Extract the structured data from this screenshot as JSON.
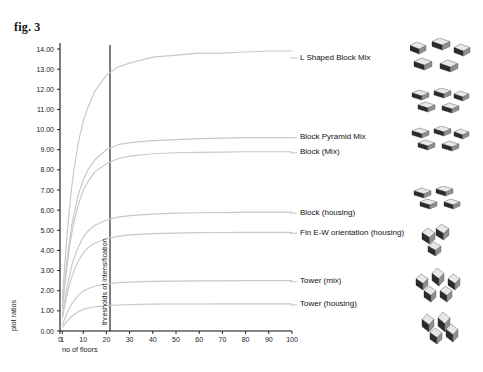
{
  "figure": {
    "label": "fig. 3"
  },
  "chart_data": {
    "type": "line",
    "title": "",
    "xlabel": "no of floors",
    "ylabel": "plot ratios",
    "xlim": [
      0,
      100
    ],
    "ylim": [
      0,
      14
    ],
    "grid": false,
    "legend_position": "right-inline",
    "x_ticks": [
      "0",
      "1",
      "10",
      "20",
      "30",
      "40",
      "50",
      "60",
      "70",
      "80",
      "90",
      "100"
    ],
    "y_ticks": [
      "0.00",
      "1.00",
      "2.00",
      "3.00",
      "4.00",
      "5.00",
      "6.00",
      "7.00",
      "8.00",
      "9.00",
      "10.00",
      "11.00",
      "12.00",
      "13.00",
      "14.00"
    ],
    "annotations": [
      {
        "name": "thresholds-of-intensification",
        "text": "thresholds of intensification",
        "x": 20
      }
    ],
    "x": [
      1,
      2,
      3,
      4,
      5,
      6,
      8,
      10,
      12,
      15,
      20,
      25,
      30,
      40,
      50,
      60,
      70,
      80,
      90,
      100
    ],
    "series": [
      {
        "name": "L Shaped Block Mix",
        "label": "L Shaped Block Mix",
        "color": "#c9c9c9",
        "asymptote": 13.9,
        "values": [
          1.6,
          3.2,
          4.7,
          6.0,
          7.1,
          8.0,
          9.4,
          10.4,
          11.1,
          11.9,
          12.7,
          13.1,
          13.3,
          13.6,
          13.7,
          13.8,
          13.8,
          13.85,
          13.9,
          13.9
        ]
      },
      {
        "name": "Block Pyramid Mix",
        "label": "Block Pyramid Mix",
        "color": "#c9c9c9",
        "asymptote": 9.6,
        "values": [
          1.2,
          2.4,
          3.5,
          4.4,
          5.2,
          5.8,
          6.8,
          7.5,
          8.0,
          8.5,
          9.0,
          9.25,
          9.35,
          9.45,
          9.5,
          9.55,
          9.58,
          9.6,
          9.6,
          9.6
        ]
      },
      {
        "name": "Block (Mix)",
        "label": "Block (Mix)",
        "color": "#c9c9c9",
        "asymptote": 8.9,
        "values": [
          1.1,
          2.2,
          3.2,
          4.1,
          4.8,
          5.4,
          6.3,
          7.0,
          7.4,
          7.9,
          8.3,
          8.55,
          8.68,
          8.8,
          8.85,
          8.87,
          8.88,
          8.9,
          8.9,
          8.9
        ]
      },
      {
        "name": "Block (housing)",
        "label": "Block (housing)",
        "color": "#c9c9c9",
        "asymptote": 5.9,
        "values": [
          0.75,
          1.5,
          2.15,
          2.7,
          3.2,
          3.6,
          4.2,
          4.65,
          4.95,
          5.25,
          5.5,
          5.65,
          5.73,
          5.8,
          5.85,
          5.87,
          5.88,
          5.9,
          5.9,
          5.9
        ]
      },
      {
        "name": "Fin E-W orientation (housing)",
        "label": "Fin E-W orientation (housing)",
        "color": "#c9c9c9",
        "asymptote": 4.9,
        "values": [
          0.62,
          1.24,
          1.8,
          2.25,
          2.65,
          3.0,
          3.5,
          3.87,
          4.12,
          4.37,
          4.58,
          4.7,
          4.77,
          4.83,
          4.86,
          4.88,
          4.89,
          4.9,
          4.9,
          4.9
        ]
      },
      {
        "name": "Tower (mix)",
        "label": "Tower (mix)",
        "color": "#c9c9c9",
        "asymptote": 2.5,
        "values": [
          0.3,
          0.6,
          0.88,
          1.12,
          1.33,
          1.5,
          1.78,
          1.98,
          2.1,
          2.22,
          2.33,
          2.4,
          2.43,
          2.46,
          2.48,
          2.49,
          2.49,
          2.5,
          2.5,
          2.5
        ]
      },
      {
        "name": "Tower (housing)",
        "label": "Tower (housing)",
        "color": "#c9c9c9",
        "asymptote": 1.35,
        "values": [
          0.17,
          0.33,
          0.48,
          0.61,
          0.72,
          0.81,
          0.96,
          1.07,
          1.13,
          1.2,
          1.26,
          1.29,
          1.31,
          1.33,
          1.34,
          1.34,
          1.35,
          1.35,
          1.35,
          1.35
        ]
      }
    ],
    "callouts": [
      {
        "name": "callout-l-shaped-block-mix",
        "label": "L Shaped Block Mix",
        "y_value": 13.55
      },
      {
        "name": "callout-block-pyramid-mix",
        "label": "Block Pyramid Mix",
        "y_value": 9.6
      },
      {
        "name": "callout-block-mix",
        "label": "Block (Mix)",
        "y_value": 8.85
      },
      {
        "name": "callout-block-housing",
        "label": "Block (housing)",
        "y_value": 5.85
      },
      {
        "name": "callout-fin-ew-orientation-housing",
        "label": "Fin E-W orientation (housing)",
        "y_value": 4.85
      },
      {
        "name": "callout-tower-mix",
        "label": "Tower (mix)",
        "y_value": 2.45
      },
      {
        "name": "callout-tower-housing",
        "label": "Tower (housing)",
        "y_value": 1.3
      }
    ]
  },
  "thumbnails": [
    {
      "name": "thumb-l-shaped-block-mix",
      "for": "L Shaped Block Mix"
    },
    {
      "name": "thumb-block-pyramid-mix",
      "for": "Block Pyramid Mix"
    },
    {
      "name": "thumb-block-mix",
      "for": "Block (Mix)"
    },
    {
      "name": "thumb-block-housing",
      "for": "Block (housing)"
    },
    {
      "name": "thumb-fin-ew-orientation-housing",
      "for": "Fin E-W orientation (housing)"
    },
    {
      "name": "thumb-tower-mix",
      "for": "Tower (mix)"
    },
    {
      "name": "thumb-tower-housing",
      "for": "Tower (housing)"
    }
  ]
}
